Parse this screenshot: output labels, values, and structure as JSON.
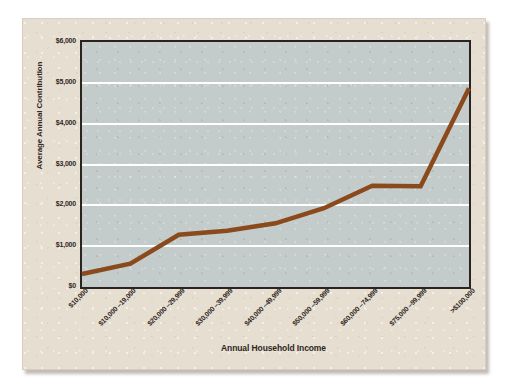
{
  "chart_data": {
    "type": "line",
    "title": "",
    "xlabel": "Annual Household Income",
    "ylabel": "Average Annual Contribution",
    "categories": [
      "$10,000",
      "$10,000 –19,000",
      "$20,000 –29,999",
      "$30,000 –39,999",
      "$40,000 –49,999",
      "$50,000 –59,999",
      "$60,000 –74,999",
      "$75,000 –99,999",
      ">$100,000"
    ],
    "values": [
      320,
      570,
      1280,
      1380,
      1560,
      1930,
      2480,
      2470,
      4870
    ],
    "ylim": [
      0,
      6000
    ],
    "yticks": [
      0,
      1000,
      2000,
      3000,
      4000,
      5000,
      6000
    ],
    "ytick_labels": [
      "$0",
      "$1,000",
      "$2,000",
      "$3,000",
      "$4,000",
      "$5,000",
      "$6,000"
    ],
    "grid": true,
    "gridline_color": "#ffffff",
    "legend": null,
    "series": [
      {
        "name": "Average Annual Contribution",
        "color": "#8a4a1c",
        "values": [
          320,
          570,
          1280,
          1380,
          1560,
          1930,
          2480,
          2470,
          4870
        ]
      }
    ]
  },
  "colors": {
    "page_background": "#ffffff",
    "card_background": "#e7ded2",
    "plot_background": "#c3cbcb",
    "axis_frame": "#2b2320",
    "line": "#8a4a1c",
    "text": "#2e2722"
  }
}
